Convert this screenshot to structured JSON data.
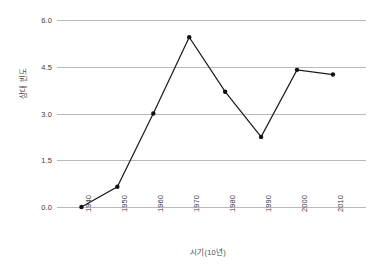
{
  "chart_data": {
    "type": "line",
    "title": "",
    "subtitle": "",
    "xlabel": "시기(10년)",
    "ylabel": "상대 빈도",
    "categories": [
      "1940",
      "1950",
      "1960",
      "1970",
      "1980",
      "1990",
      "2000",
      "2010"
    ],
    "values": [
      0.0,
      0.65,
      3.0,
      5.45,
      3.7,
      2.25,
      4.4,
      4.25
    ],
    "series": [
      {
        "name": "상대 빈도",
        "values": [
          0.0,
          0.65,
          3.0,
          5.45,
          3.7,
          2.25,
          4.4,
          4.25
        ]
      }
    ],
    "ylim": [
      0.0,
      6.0
    ],
    "y_ticks": [
      "0.0",
      "1.5",
      "3.0",
      "4.5",
      "6.0"
    ],
    "y_tick_values": [
      0.0,
      1.5,
      3.0,
      4.5,
      6.0
    ],
    "x_tick_labels": [
      "1940",
      "1950",
      "1960",
      "1970",
      "1980",
      "1990",
      "2000",
      "2010"
    ],
    "grid": "horizontal",
    "legend": "none",
    "marker": "filled-circle",
    "line_color": "#1a1a1a",
    "grid_color": "#b9b9b9",
    "background_color": "#ffffff",
    "x_tick_rotation": -90
  }
}
